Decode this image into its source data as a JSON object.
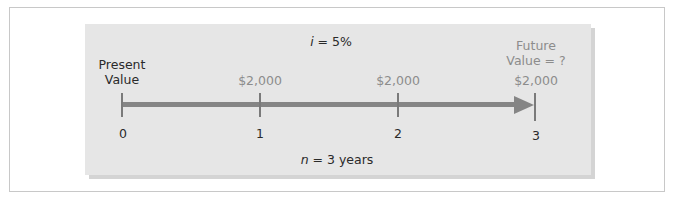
{
  "diagram": {
    "interest": {
      "symbol": "i",
      "equals": " = ",
      "value": "5%"
    },
    "periods_label": {
      "symbol": "n",
      "equals": " = ",
      "value": "3 years"
    },
    "present_value_label": {
      "line1": "Present",
      "line2": "Value"
    },
    "future_value_label": {
      "line1": "Future",
      "line2": "Value = ?"
    },
    "timeline": {
      "ticks": [
        {
          "period": "0",
          "payment": ""
        },
        {
          "period": "1",
          "payment": "$2,000"
        },
        {
          "period": "2",
          "payment": "$2,000"
        },
        {
          "period": "3",
          "payment": "$2,000"
        }
      ],
      "direction": "left-to-right arrow toward period 3"
    },
    "colors": {
      "panel": "#e6e6e6",
      "panel_shadow": "#d4d4d4",
      "axis": "#858585",
      "tick": "#7a7a7a",
      "dark_text": "#2a2a2a",
      "gray_text": "#8c8c8c",
      "frame_border": "#c8c8c8"
    }
  }
}
